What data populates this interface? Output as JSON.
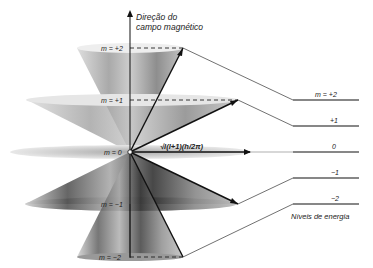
{
  "diagram": {
    "axis_label_line1": "Direção do",
    "axis_label_line2": "campo magnético",
    "vector_label": "√l(l+1)(h/2π)",
    "cone_labels": {
      "m_plus2": "m = +2",
      "m_plus1": "m = +1",
      "m_0": "m = 0",
      "m_minus1": "m = −1",
      "m_minus2": "m = −2"
    },
    "energy_levels": {
      "plus2": "m = +2",
      "plus1": "+1",
      "zero": "0",
      "minus1": "−1",
      "minus2": "−2"
    },
    "energy_caption": "Níveis de energia"
  }
}
